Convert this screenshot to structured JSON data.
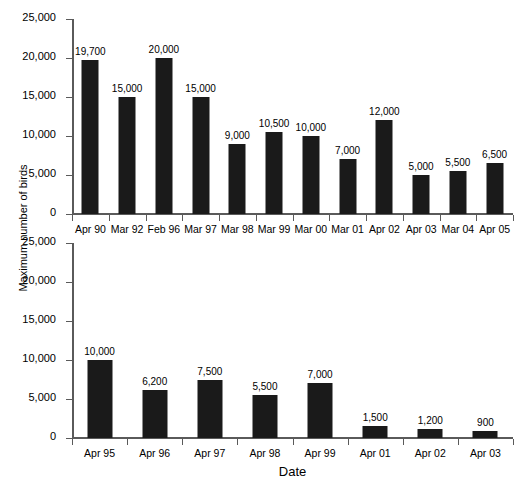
{
  "figure": {
    "y_axis_title": "Maximum number of birds",
    "x_axis_title": "Date"
  },
  "chart_data": [
    {
      "type": "bar",
      "panel": "top",
      "title": "",
      "xlabel": "Date",
      "ylabel": "Maximum number of birds",
      "ylim": [
        0,
        25000
      ],
      "ytick_labels": [
        "0",
        "5,000",
        "10,000",
        "15,000",
        "20,000",
        "25,000"
      ],
      "yticks": [
        0,
        5000,
        10000,
        15000,
        20000,
        25000
      ],
      "grid": false,
      "legend": "none",
      "categories": [
        "Apr 90",
        "Mar 92",
        "Feb 96",
        "Mar 97",
        "Mar 98",
        "Mar 99",
        "Mar 00",
        "Mar 01",
        "Apr 02",
        "Apr 03",
        "Mar 04",
        "Apr 05"
      ],
      "values": [
        19700,
        15000,
        20000,
        15000,
        9000,
        10500,
        10000,
        7000,
        12000,
        5000,
        5500,
        6500
      ],
      "value_labels": [
        "19,700",
        "15,000",
        "20,000",
        "15,000",
        "9,000",
        "10,500",
        "10,000",
        "7,000",
        "12,000",
        "5,000",
        "5,500",
        "6,500"
      ]
    },
    {
      "type": "bar",
      "panel": "bottom",
      "title": "",
      "xlabel": "Date",
      "ylabel": "Maximum number of birds",
      "ylim": [
        0,
        25000
      ],
      "ytick_labels": [
        "0",
        "5,000",
        "10,000",
        "15,000",
        "20,000",
        "25,000"
      ],
      "yticks": [
        0,
        5000,
        10000,
        15000,
        20000,
        25000
      ],
      "grid": false,
      "legend": "none",
      "categories": [
        "Apr 95",
        "Apr 96",
        "Apr 97",
        "Apr 98",
        "Apr 99",
        "Apr 01",
        "Apr 02",
        "Apr 03"
      ],
      "values": [
        10000,
        6200,
        7500,
        5500,
        7000,
        1500,
        1200,
        900
      ],
      "value_labels": [
        "10,000",
        "6,200",
        "7,500",
        "5,500",
        "7,000",
        "1,500",
        "1,200",
        "900"
      ]
    }
  ]
}
